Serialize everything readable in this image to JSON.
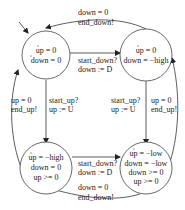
{
  "diagram": {
    "type": "hybrid-automaton",
    "states": [
      {
        "id": "s1",
        "lines": [
          "up = 0",
          "down = 0"
        ],
        "dotted": [
          true,
          true
        ]
      },
      {
        "id": "s2",
        "lines": [
          "up = 0",
          "down = −high"
        ],
        "dotted": [
          true,
          true
        ]
      },
      {
        "id": "s3",
        "lines": [
          "up = −high",
          "down = 0",
          "up >= 0"
        ],
        "dotted": [
          true,
          true,
          false
        ]
      },
      {
        "id": "s4",
        "lines": [
          "up = −low",
          "down = −low",
          "down >= 0",
          "up >= 0"
        ],
        "dotted": [
          true,
          true,
          false,
          false
        ]
      }
    ],
    "transitions": [
      {
        "from": "s2",
        "to": "s1",
        "lines": [
          "down = 0",
          "end_down!"
        ]
      },
      {
        "from": "s1",
        "to": "s2",
        "lines": [
          "start_down?",
          "down := D"
        ]
      },
      {
        "from": "s3",
        "to": "s1",
        "lines": [
          "up = 0",
          "end_up!"
        ]
      },
      {
        "from": "s1",
        "to": "s3",
        "lines": [
          "start_up?",
          "up := U"
        ]
      },
      {
        "from": "s2",
        "to": "s4",
        "lines": [
          "start_up?",
          "up := U"
        ]
      },
      {
        "from": "s4",
        "to": "s2",
        "lines": [
          "up = 0",
          "end_up!"
        ]
      },
      {
        "from": "s3",
        "to": "s4",
        "lines": [
          "start_down?",
          "down := D"
        ]
      },
      {
        "from": "s4",
        "to": "s3",
        "lines": [
          "down = 0",
          "end_down!"
        ]
      }
    ]
  }
}
